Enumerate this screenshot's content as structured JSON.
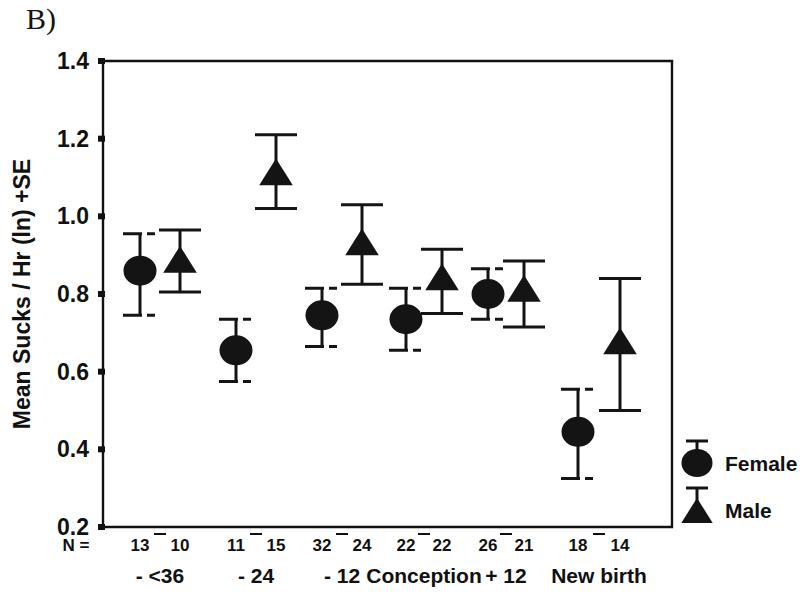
{
  "panel": {
    "label": "B)"
  },
  "chart_data": {
    "type": "scatter",
    "title": "",
    "xlabel": "",
    "ylabel": "Mean Sucks / Hr (ln) +SE",
    "ylim": [
      0.2,
      1.4
    ],
    "yticks": [
      0.2,
      0.4,
      0.6,
      0.8,
      1.0,
      1.2,
      1.4
    ],
    "ytick_labels": [
      "0.2",
      "0.4",
      "0.6",
      "0.8",
      "1.0",
      "1.2",
      "1.4"
    ],
    "grid": false,
    "legend_position": "right",
    "n_prefix": "N =",
    "categories": [
      "- <36",
      "- 24",
      "- 12",
      "Conception",
      "+ 12",
      "New birth"
    ],
    "series": [
      {
        "name": "Female",
        "marker": "circle",
        "color": "#141414",
        "values": [
          0.86,
          0.655,
          0.745,
          0.735,
          0.8,
          0.445
        ],
        "se_upper": [
          0.955,
          0.735,
          0.815,
          0.815,
          0.865,
          0.555
        ],
        "se_lower": [
          0.745,
          0.575,
          0.665,
          0.655,
          0.735,
          0.325
        ],
        "n": [
          13,
          11,
          32,
          22,
          26,
          18
        ]
      },
      {
        "name": "Male",
        "marker": "triangle",
        "color": "#141414",
        "values": [
          0.885,
          1.11,
          0.93,
          0.84,
          0.81,
          0.675
        ],
        "se_upper": [
          0.965,
          1.21,
          1.03,
          0.915,
          0.885,
          0.84
        ],
        "se_lower": [
          0.805,
          1.02,
          0.825,
          0.75,
          0.715,
          0.5
        ],
        "n": [
          10,
          15,
          24,
          22,
          21,
          14
        ]
      }
    ],
    "legend": [
      {
        "label": "Female",
        "marker": "circle"
      },
      {
        "label": "Male",
        "marker": "triangle"
      }
    ]
  }
}
